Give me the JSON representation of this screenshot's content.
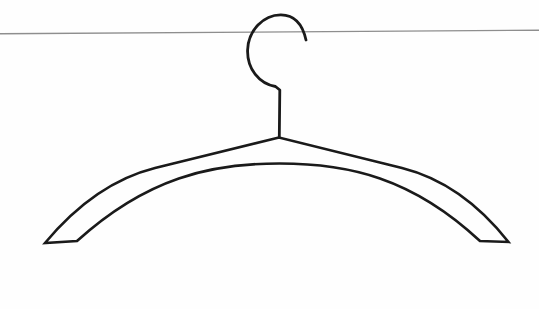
{
  "scene": {
    "kind": "black-and-white line-art illustration",
    "subject": "clothes hanger hanging by its hook on a thin horizontal wire rail",
    "background_color": "#fefefe",
    "ink_color": "#1a1a1a",
    "rail_color": "#8e8e8e"
  },
  "canvas": {
    "width": 539,
    "height": 309,
    "viewbox": "0 0 539 309"
  },
  "rail": {
    "x1": 0,
    "y1": 33.8,
    "x2": 539,
    "y2": 30.2,
    "stroke_width": 1.4
  },
  "hook": {
    "path": "M 306,40 C 303,26 295.5,15 281,14.8 C 263.5,14.6 248.2,30.5 247.6,50 C 247,69 259.5,84 275.5,86.5 L 279.8,90 L 279.3,137",
    "stroke_width": 2.8
  },
  "body": {
    "path": "M 279,137.5 L 155,168 Q 95,183 45,243 L 77,241 C 147,177.5 211,163.5 279.5,163.5 C 348,163.5 412,177.5 480,241 L 508.5,242 Q 462,183 402,168 Z",
    "stroke_width": 2.6
  }
}
